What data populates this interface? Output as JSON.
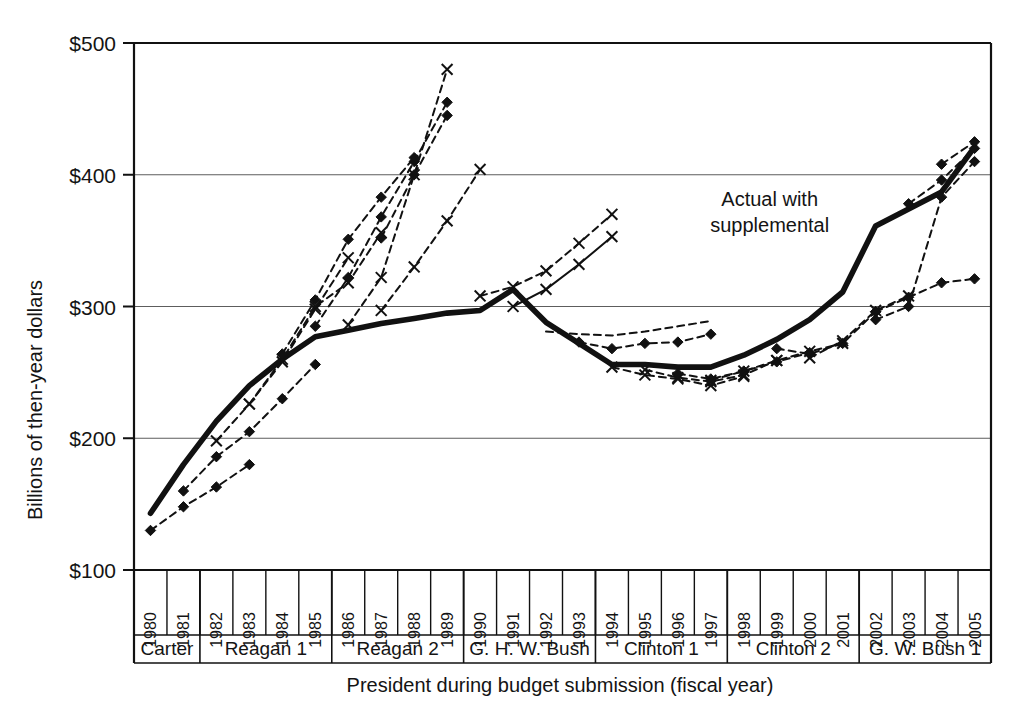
{
  "chart_data": {
    "type": "line",
    "title": "",
    "xlabel": "President during budget submission (fiscal year)",
    "ylabel": "Billions of then-year dollars",
    "ylim": [
      100,
      500
    ],
    "yticks": [
      100,
      200,
      300,
      400,
      500
    ],
    "ytick_labels": [
      "$100",
      "$200",
      "$300",
      "$400",
      "$500"
    ],
    "grid": "horizontal",
    "legend_position": "none",
    "x": [
      1980,
      1981,
      1982,
      1983,
      1984,
      1985,
      1986,
      1987,
      1988,
      1989,
      1990,
      1991,
      1992,
      1993,
      1994,
      1995,
      1996,
      1997,
      1998,
      1999,
      2000,
      2001,
      2002,
      2003,
      2004,
      2005
    ],
    "xtick_labels": [
      "1980",
      "1981",
      "1982",
      "1983",
      "1984",
      "1985",
      "1986",
      "1987",
      "1988",
      "1989",
      "1990",
      "1991",
      "1992",
      "1993",
      "1994",
      "1995",
      "1996",
      "1997",
      "1998",
      "1999",
      "2000",
      "2001",
      "2002",
      "2003",
      "2004",
      "2005"
    ],
    "group_labels": [
      "Carter",
      "Reagan 1",
      "Reagan 2",
      "G. H. W. Bush",
      "Clinton 1",
      "Clinton 2",
      "G. W. Bush 1"
    ],
    "groups": [
      {
        "label": "Carter",
        "start_year": 1980,
        "end_year": 1981
      },
      {
        "label": "Reagan 1",
        "start_year": 1982,
        "end_year": 1985
      },
      {
        "label": "Reagan 2",
        "start_year": 1986,
        "end_year": 1989
      },
      {
        "label": "G. H. W. Bush",
        "start_year": 1990,
        "end_year": 1993
      },
      {
        "label": "Clinton 1",
        "start_year": 1994,
        "end_year": 1997
      },
      {
        "label": "Clinton 2",
        "start_year": 1998,
        "end_year": 2001
      },
      {
        "label": "G. W. Bush 1",
        "start_year": 2002,
        "end_year": 2005
      }
    ],
    "annotations": [
      {
        "text": "Actual with supplemental",
        "x_year": 2000,
        "y_value": 372
      }
    ],
    "series": [
      {
        "name": "Actual with supplemental",
        "style": "solid-thick",
        "marker": "none",
        "x": [
          1980,
          1981,
          1982,
          1983,
          1984,
          1985,
          1986,
          1987,
          1988,
          1989,
          1990,
          1991,
          1992,
          1993,
          1994,
          1995,
          1996,
          1997,
          1998,
          1999,
          2000,
          2001,
          2002,
          2003,
          2004,
          2005
        ],
        "values": [
          143,
          180,
          213,
          240,
          260,
          277,
          282,
          287,
          291,
          295,
          297,
          313,
          288,
          272,
          256,
          256,
          254,
          254,
          263,
          275,
          290,
          311,
          361,
          374,
          387,
          421
        ]
      },
      {
        "name": "FY1980 projection",
        "style": "dashed",
        "marker": "diamond",
        "x": [
          1980,
          1981,
          1982,
          1983
        ],
        "values": [
          130,
          148,
          163,
          180
        ]
      },
      {
        "name": "FY1981 projection",
        "style": "dashed",
        "marker": "diamond",
        "x": [
          1981,
          1982,
          1983,
          1984,
          1985
        ],
        "values": [
          160,
          186,
          205,
          230,
          256
        ]
      },
      {
        "name": "FY1982 projection",
        "style": "dashed",
        "marker": "cross",
        "x": [
          1982,
          1983,
          1984,
          1985,
          1986
        ],
        "values": [
          198,
          226,
          258,
          298,
          337
        ]
      },
      {
        "name": "FY1983 projection",
        "style": "dashed",
        "marker": "cross",
        "x": [
          1983,
          1984,
          1985,
          1986,
          1987
        ],
        "values": [
          226,
          260,
          300,
          318,
          356
        ]
      },
      {
        "name": "FY1984 projection",
        "style": "dashed",
        "marker": "diamond",
        "x": [
          1984,
          1985,
          1986,
          1987,
          1988
        ],
        "values": [
          264,
          305,
          351,
          383,
          413
        ]
      },
      {
        "name": "FY1985 projection",
        "style": "dashed",
        "marker": "diamond",
        "x": [
          1985,
          1986,
          1987,
          1988,
          1989
        ],
        "values": [
          285,
          322,
          368,
          410,
          455
        ]
      },
      {
        "name": "FY1986 projection",
        "style": "dashed",
        "marker": "cross",
        "x": [
          1986,
          1987,
          1988,
          1989
        ],
        "values": [
          286,
          322,
          400,
          480
        ]
      },
      {
        "name": "FY1987 projection",
        "style": "dashed",
        "marker": "diamond",
        "x": [
          1987,
          1988,
          1989
        ],
        "values": [
          352,
          400,
          445
        ]
      },
      {
        "name": "FY1988 projection",
        "style": "dashed",
        "marker": "cross",
        "x": [
          1987,
          1988,
          1989,
          1990
        ],
        "values": [
          297,
          330,
          365,
          404
        ]
      },
      {
        "name": "FY1990 projection",
        "style": "dashed",
        "marker": "cross",
        "x": [
          1990,
          1991,
          1992,
          1993,
          1994
        ],
        "values": [
          308,
          315,
          327,
          348,
          370
        ]
      },
      {
        "name": "FY1991 projection",
        "style": "solid-thin",
        "marker": "cross",
        "x": [
          1991,
          1992,
          1993,
          1994
        ],
        "values": [
          300,
          313,
          332,
          353
        ]
      },
      {
        "name": "FY1992 projection",
        "style": "dashed",
        "marker": "none",
        "x": [
          1992,
          1993,
          1994,
          1995,
          1996,
          1997
        ],
        "values": [
          281,
          279,
          278,
          281,
          285,
          289
        ]
      },
      {
        "name": "FY1993 projection",
        "style": "dashed",
        "marker": "diamond",
        "x": [
          1993,
          1994,
          1995,
          1996,
          1997
        ],
        "values": [
          273,
          268,
          272,
          273,
          279
        ]
      },
      {
        "name": "FY1994 projection",
        "style": "dashed",
        "marker": "cross",
        "x": [
          1994,
          1995,
          1996,
          1997,
          1998
        ],
        "values": [
          254,
          248,
          245,
          240,
          247
        ]
      },
      {
        "name": "FY1995 projection",
        "style": "dashed",
        "marker": "cross",
        "x": [
          1995,
          1996,
          1997,
          1998,
          1999
        ],
        "values": [
          252,
          246,
          243,
          248,
          259
        ]
      },
      {
        "name": "FY1996 projection",
        "style": "dashed",
        "marker": "diamond",
        "x": [
          1996,
          1997,
          1998,
          1999,
          2000
        ],
        "values": [
          249,
          245,
          251,
          258,
          265
        ]
      },
      {
        "name": "FY1997 projection",
        "style": "dashed",
        "marker": "cross",
        "x": [
          1997,
          1998,
          1999,
          2000,
          2001
        ],
        "values": [
          244,
          251,
          259,
          266,
          272
        ]
      },
      {
        "name": "FY1999 projection",
        "style": "dashed",
        "marker": "diamond",
        "x": [
          1999,
          2000,
          2001,
          2002
        ],
        "values": [
          268,
          264,
          272,
          296
        ]
      },
      {
        "name": "FY2000 projection",
        "style": "dashed",
        "marker": "cross",
        "x": [
          2000,
          2001,
          2002,
          2003
        ],
        "values": [
          261,
          274,
          297,
          308
        ]
      },
      {
        "name": "FY2002 projection",
        "style": "dashed",
        "marker": "diamond",
        "x": [
          2002,
          2003,
          2004,
          2005
        ],
        "values": [
          296,
          307,
          318,
          321
        ]
      },
      {
        "name": "FY2003 projection",
        "style": "dashed",
        "marker": "diamond",
        "x": [
          2002,
          2003,
          2004,
          2005
        ],
        "values": [
          290,
          300,
          383,
          410
        ]
      },
      {
        "name": "FY2004 projection",
        "style": "dashed",
        "marker": "diamond",
        "x": [
          2003,
          2004,
          2005
        ],
        "values": [
          378,
          396,
          420
        ]
      },
      {
        "name": "FY2005 projection",
        "style": "dashed",
        "marker": "diamond",
        "x": [
          2004,
          2005
        ],
        "values": [
          408,
          425
        ]
      }
    ]
  }
}
